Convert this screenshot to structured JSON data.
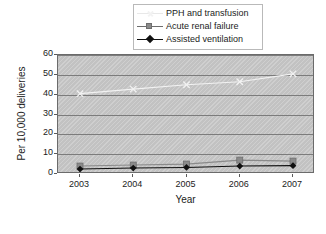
{
  "chart_data": {
    "type": "line",
    "title": "",
    "xlabel": "Year",
    "ylabel": "Per 10,000 deliveries",
    "categories": [
      "2003",
      "2004",
      "2005",
      "2006",
      "2007"
    ],
    "x": [
      2003,
      2004,
      2005,
      2006,
      2007
    ],
    "ylim": [
      0,
      60
    ],
    "yticks": [
      "0",
      "10",
      "20",
      "30",
      "40",
      "50",
      "60"
    ],
    "ytick_values": [
      0,
      10,
      20,
      30,
      40,
      50,
      60
    ],
    "grid": true,
    "legend_position": "top-center",
    "plot_background": "#c2c2c2",
    "series": [
      {
        "name": "PPH and transfusion",
        "values": [
          40.5,
          42.8,
          45.0,
          46.5,
          50.5
        ],
        "color": "#f2f2f2",
        "marker": "cross"
      },
      {
        "name": "Acute renal failure",
        "values": [
          4.0,
          4.5,
          5.0,
          7.0,
          6.5
        ],
        "color": "#8a8a8a",
        "marker": "square"
      },
      {
        "name": "Assisted ventilation",
        "values": [
          2.5,
          3.0,
          3.3,
          4.0,
          4.2
        ],
        "color": "#101010",
        "marker": "diamond"
      }
    ]
  },
  "legend": {
    "items": [
      {
        "label": "PPH and transfusion"
      },
      {
        "label": "Acute renal failure"
      },
      {
        "label": "Assisted ventilation"
      }
    ]
  },
  "axes": {
    "y_title": "Per 10,000 deliveries",
    "x_title": "Year",
    "y_tick_labels": [
      "60",
      "50",
      "40",
      "30",
      "20",
      "10",
      "0"
    ],
    "x_tick_labels": [
      "2003",
      "2004",
      "2005",
      "2006",
      "2007"
    ]
  },
  "colors": {
    "plot_fill": "#c2c2c2",
    "gridline": "#7c7c7c",
    "frame": "#6b6b6b",
    "text": "#1b1b1b",
    "series_pph": "#f2f2f2",
    "series_renal": "#8a8a8a",
    "series_ventilation": "#101010"
  }
}
